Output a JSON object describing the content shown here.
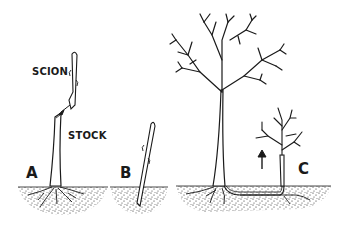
{
  "figure": {
    "panels": [
      {
        "id": "A",
        "label": "A",
        "description": "graft: scion joined onto stock"
      },
      {
        "id": "B",
        "label": "B",
        "description": "cutting planted in soil"
      },
      {
        "id": "C",
        "label": "C",
        "description": "sucker rising from root of parent tree"
      }
    ],
    "annotations": {
      "scion": "SCION",
      "stock": "STOCK"
    },
    "colors": {
      "ink": "#1a1a1a",
      "background": "#ffffff"
    }
  }
}
